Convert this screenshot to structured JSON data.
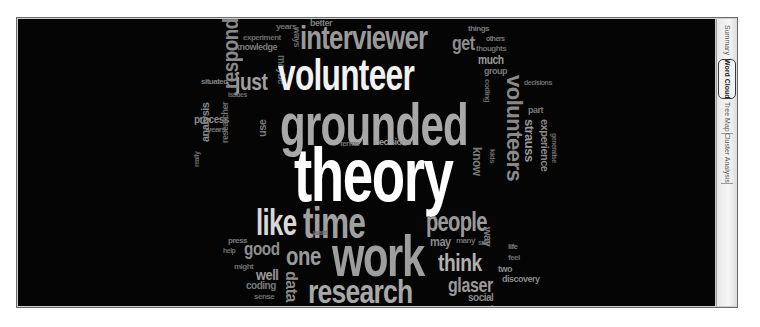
{
  "side_tabs": [
    {
      "label": "Summary",
      "active": false
    },
    {
      "label": "Word Cloud",
      "active": true
    },
    {
      "label": "Tree Map",
      "active": false
    },
    {
      "label": "Cluster Analysis",
      "active": false
    }
  ],
  "word_cloud": {
    "colors": {
      "background": "#050505",
      "primary": "#ffffff",
      "secondary": "#a8a8a8",
      "tertiary": "#7a7a7a"
    },
    "words": [
      {
        "text": "theory",
        "size": "largest"
      },
      {
        "text": "grounded",
        "size": "xlarge"
      },
      {
        "text": "volunteer",
        "size": "xlarge"
      },
      {
        "text": "interviewer",
        "size": "large"
      },
      {
        "text": "time",
        "size": "large"
      },
      {
        "text": "work",
        "size": "large"
      },
      {
        "text": "like",
        "size": "large"
      },
      {
        "text": "research",
        "size": "large"
      },
      {
        "text": "people",
        "size": "medium"
      },
      {
        "text": "respondent",
        "size": "medium"
      },
      {
        "text": "volunteers",
        "size": "medium"
      },
      {
        "text": "one",
        "size": "medium"
      },
      {
        "text": "think",
        "size": "medium"
      },
      {
        "text": "glaser",
        "size": "medium"
      },
      {
        "text": "just",
        "size": "medium"
      },
      {
        "text": "strauss",
        "size": "small"
      },
      {
        "text": "experience",
        "size": "small"
      },
      {
        "text": "good",
        "size": "small"
      },
      {
        "text": "well",
        "size": "small"
      },
      {
        "text": "qualitative",
        "size": "small"
      },
      {
        "text": "validity",
        "size": "small"
      },
      {
        "text": "data",
        "size": "small"
      },
      {
        "text": "get",
        "size": "small"
      },
      {
        "text": "much",
        "size": "small"
      },
      {
        "text": "analysis",
        "size": "small"
      },
      {
        "text": "process",
        "size": "small"
      },
      {
        "text": "use",
        "size": "small"
      },
      {
        "text": "know",
        "size": "small"
      },
      {
        "text": "way",
        "size": "small"
      },
      {
        "text": "may",
        "size": "small"
      },
      {
        "text": "two",
        "size": "small"
      },
      {
        "text": "discovery",
        "size": "small"
      },
      {
        "text": "social",
        "size": "small"
      },
      {
        "text": "knowledge",
        "size": "tiny"
      },
      {
        "text": "experiment",
        "size": "tiny"
      },
      {
        "text": "situated",
        "size": "tiny"
      },
      {
        "text": "years",
        "size": "tiny"
      },
      {
        "text": "things",
        "size": "tiny"
      },
      {
        "text": "others",
        "size": "tiny"
      },
      {
        "text": "thoughts",
        "size": "tiny"
      },
      {
        "text": "group",
        "size": "tiny"
      },
      {
        "text": "coding",
        "size": "tiny"
      },
      {
        "text": "sense",
        "size": "tiny"
      },
      {
        "text": "might",
        "size": "tiny"
      },
      {
        "text": "maybe",
        "size": "tiny"
      },
      {
        "text": "issues",
        "size": "tiny"
      },
      {
        "text": "really",
        "size": "tiny"
      },
      {
        "text": "kids",
        "size": "tiny"
      },
      {
        "text": "life",
        "size": "tiny"
      },
      {
        "text": "want",
        "size": "tiny"
      },
      {
        "text": "many",
        "size": "tiny"
      },
      {
        "text": "said",
        "size": "tiny"
      },
      {
        "text": "decisions",
        "size": "tiny"
      },
      {
        "text": "generalise",
        "size": "tiny"
      },
      {
        "text": "part",
        "size": "tiny"
      },
      {
        "text": "terms",
        "size": "tiny"
      },
      {
        "text": "press",
        "size": "tiny"
      },
      {
        "text": "help",
        "size": "tiny"
      },
      {
        "text": "better",
        "size": "tiny"
      },
      {
        "text": "researcher",
        "size": "tiny"
      },
      {
        "text": "feel",
        "size": "tiny"
      },
      {
        "text": "ways",
        "size": "tiny"
      },
      {
        "text": "also",
        "size": "tiny"
      }
    ]
  }
}
